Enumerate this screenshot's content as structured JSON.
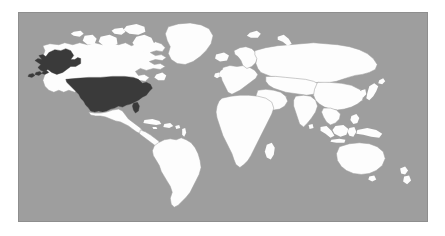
{
  "figure": {
    "type": "choropleth-world-map",
    "projection": "equirectangular",
    "panel": {
      "x": 18,
      "y": 12,
      "width": 410,
      "height": 210
    },
    "border_color": "#8e8e8e",
    "outer_background": "#ffffff"
  },
  "legend_colors": {
    "ocean": "#9e9e9e",
    "land": "#fdfdfd",
    "land_border": "#9e9e9e",
    "highlight": "#3a3a3a"
  },
  "map_data": {
    "type": "choropleth",
    "highlighted_regions": [
      {
        "name": "United States of America",
        "code": "USA",
        "color": "#3a3a3a",
        "includes": [
          "Contiguous United States",
          "Alaska"
        ]
      }
    ],
    "unhighlighted_fill": "#fdfdfd",
    "ocean_fill": "#9e9e9e",
    "country_borders_visible": true,
    "graticule_visible": false,
    "labels_visible": false,
    "continents_shown": [
      "North America",
      "South America",
      "Europe",
      "Africa",
      "Asia",
      "Oceania"
    ],
    "notable_landmasses": [
      "Greenland",
      "Canada",
      "Mexico",
      "Brazil",
      "Russia",
      "China",
      "India",
      "Australia",
      "New Zealand",
      "Japan",
      "Madagascar",
      "Indonesia",
      "Iceland",
      "United Kingdom",
      "Philippines",
      "Sri Lanka",
      "Svalbard",
      "New Guinea"
    ]
  }
}
